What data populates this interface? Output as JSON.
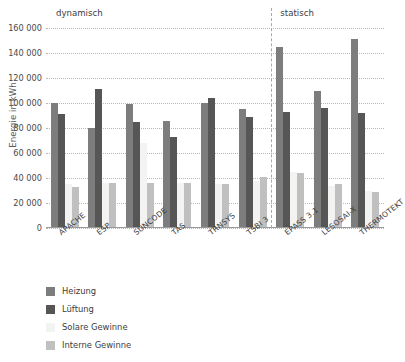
{
  "chart_data": {
    "type": "bar",
    "title": "",
    "xlabel": "",
    "ylabel": "Energie in kWh",
    "ylim": [
      0,
      160000
    ],
    "ytick_step": 20000,
    "yticks": [
      0,
      20000,
      40000,
      60000,
      80000,
      100000,
      120000,
      140000,
      160000
    ],
    "ytick_labels": [
      "0",
      "20 000",
      "40 000",
      "60 000",
      "80 000",
      "100 000",
      "120 000",
      "140 000",
      "160 000"
    ],
    "grid": true,
    "legend_position": "below-left",
    "categories": [
      "APACHE",
      "ESP",
      "SUNCODE",
      "TAS",
      "TRNSYS",
      "TSBI 3",
      "EPASS 3.1",
      "LESOSAI-X",
      "THERMOTEKT"
    ],
    "series": [
      {
        "name": "Heizung",
        "color": "#7d7d7d",
        "values": [
          100000,
          80000,
          99000,
          86000,
          100000,
          95000,
          145000,
          110000,
          151000
        ]
      },
      {
        "name": "Lüftung",
        "color": "#565656",
        "values": [
          91000,
          111000,
          85000,
          73000,
          104000,
          89000,
          93000,
          96000,
          92000
        ]
      },
      {
        "name": "Solare Gewinne",
        "color": "#f3f3f1",
        "values": [
          35000,
          36000,
          68000,
          36000,
          35000,
          38000,
          45000,
          34000,
          30000
        ]
      },
      {
        "name": "Interne Gewinne",
        "color": "#c0c0c0",
        "values": [
          33000,
          36000,
          36000,
          36000,
          35000,
          41000,
          44000,
          35000,
          29000
        ]
      }
    ],
    "annotations": [
      {
        "text": "dynamisch",
        "position": "left-group-header"
      },
      {
        "text": "statisch",
        "position": "right-group-header"
      }
    ],
    "divider_after_category": "TSBI 3"
  },
  "axis": {
    "y_title": "Energie in kWh"
  },
  "sections": {
    "left_label": "dynamisch",
    "right_label": "statisch"
  }
}
